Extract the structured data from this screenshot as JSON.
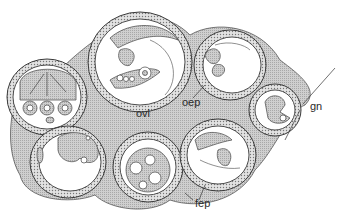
{
  "figure": {
    "type": "anatomical cross-section illustration",
    "labels": [
      {
        "id": "ovl",
        "text": "ovl",
        "x": 136,
        "y": 117
      },
      {
        "id": "oep",
        "text": "oep",
        "x": 182,
        "y": 104
      },
      {
        "id": "fep",
        "text": "fep",
        "x": 195,
        "y": 205
      },
      {
        "id": "gn",
        "text": "gn",
        "x": 310,
        "y": 108
      }
    ],
    "colors": {
      "background": "#ffffff",
      "line": "#3a3a3a",
      "shading": "#bdbdbd"
    }
  }
}
